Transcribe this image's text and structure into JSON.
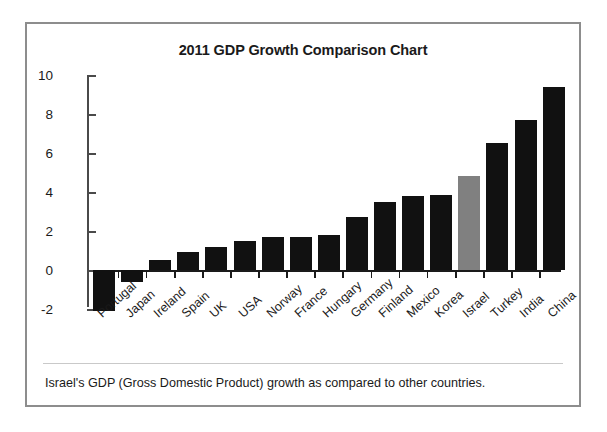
{
  "figure": {
    "title": "2011 GDP Growth Comparison Chart",
    "caption": "Israel's GDP (Gross Domestic Product) growth as compared to other countries.",
    "border_color": "#8d8d8d"
  },
  "chart_data": {
    "type": "bar",
    "title": "2011 GDP Growth Comparison Chart",
    "xlabel": "",
    "ylabel": "",
    "ylim": [
      -2,
      10
    ],
    "yticks": [
      -2,
      0,
      2,
      4,
      6,
      8,
      10
    ],
    "ytick_labels": [
      "-2",
      "0",
      "2",
      "4",
      "6",
      "8",
      "10"
    ],
    "grid": false,
    "legend": "none",
    "bar_color": "#111111",
    "highlight_color": "#808080",
    "highlight_category": "Israel",
    "categories": [
      "Portugal",
      "Japan",
      "Ireland",
      "Spain",
      "UK",
      "USA",
      "Norway",
      "France",
      "Hungary",
      "Germany",
      "Finland",
      "Mexico",
      "Korea",
      "Israel",
      "Turkey",
      "India",
      "China"
    ],
    "values": [
      -2.1,
      -0.6,
      0.5,
      0.9,
      1.2,
      1.5,
      1.7,
      1.7,
      1.8,
      2.7,
      3.5,
      3.8,
      3.85,
      4.8,
      6.5,
      7.7,
      9.4
    ],
    "annotations": [
      "Israel's GDP (Gross Domestic Product) growth as compared to other countries."
    ]
  }
}
